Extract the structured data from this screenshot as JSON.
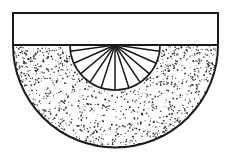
{
  "figure": {
    "title": "stippled-semicircle-with-fan-diagram",
    "canvas": {
      "width": 228,
      "height": 159,
      "background": "#ffffff"
    },
    "colors": {
      "stroke": "#1a1a1a",
      "fill_white": "#ffffff",
      "stipple": "#2b2b2b"
    },
    "rectangle": {
      "label": "upper rectangle",
      "x": 13,
      "y": 13,
      "width": 205,
      "height": 32,
      "stroke_width": 2.0,
      "fill": "#ffffff"
    },
    "semicircle": {
      "label": "stippled lower half disc",
      "center_x": 115.5,
      "center_y": 45,
      "radius": 102.5,
      "stroke_width": 2.0,
      "fill": "#ffffff",
      "texture": "stipple"
    },
    "diameter_line": {
      "label": "horizontal diameter",
      "x1": 13,
      "y1": 45,
      "x2": 218,
      "y2": 45,
      "stroke_width": 1.4
    },
    "fan": {
      "label": "inner white fan sector",
      "center_x": 115,
      "center_y": 45,
      "radius": 45,
      "stroke_width": 1.6,
      "fill": "#ffffff",
      "spoke_count": 11,
      "spoke_angles_deg": [
        8,
        24,
        40,
        56,
        72,
        90,
        108,
        124,
        140,
        156,
        172
      ],
      "spoke_stroke_width": 1.5
    },
    "stipple": {
      "dot_count": 1150,
      "dot_radius_min": 0.35,
      "dot_radius_max": 0.95,
      "seed": 20240617,
      "density_note": "denser near diameter line and near outer arc"
    }
  }
}
